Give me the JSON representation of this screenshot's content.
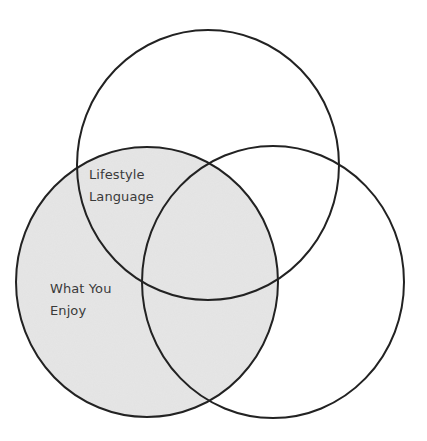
{
  "diagram": {
    "type": "venn",
    "circle_count": 3,
    "colors": {
      "stroke": "#222222",
      "shaded_fill": "#e6e6e6",
      "background": "#ffffff"
    },
    "circles": [
      {
        "id": "top",
        "cx": 208,
        "cy": 165,
        "rx": 131,
        "ry": 135,
        "shaded": false
      },
      {
        "id": "left",
        "cx": 147,
        "cy": 282,
        "rx": 131,
        "ry": 135,
        "shaded": true
      },
      {
        "id": "right",
        "cx": 273,
        "cy": 282,
        "rx": 131,
        "ry": 136,
        "shaded": false
      }
    ],
    "labels": {
      "top_left_overlap": {
        "line1": "Lifestyle",
        "line2": "Language"
      },
      "left_circle": {
        "line1": "What You",
        "line2": "Enjoy"
      }
    }
  }
}
